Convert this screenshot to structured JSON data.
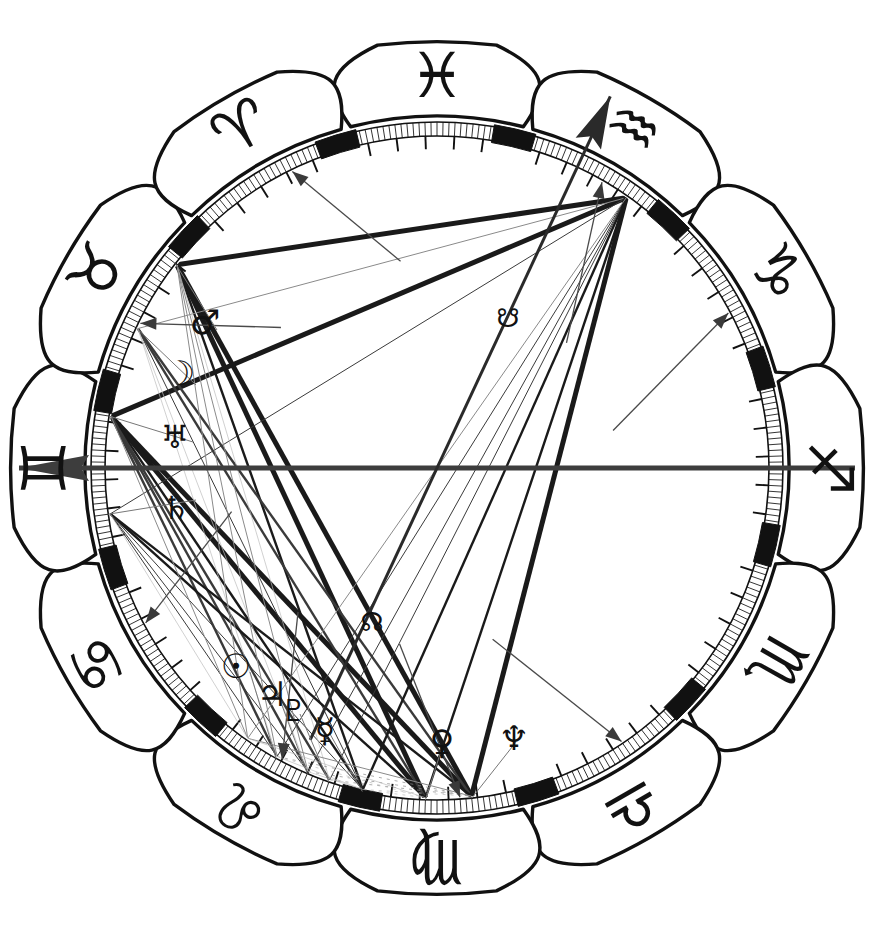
{
  "document": {
    "title": "Astrological Natal Chart Wheel",
    "type": "natal-chart",
    "width": 875,
    "height": 937,
    "background": "#ffffff",
    "ink": "#111111"
  },
  "wheel": {
    "center_x": 437,
    "center_y": 468,
    "outer_petal_radius": 430,
    "rim_outer_radius": 346,
    "rim_inner_radius": 332,
    "aspect_radius": 330,
    "degree_ring": {
      "minor_tick_step_deg": 1,
      "major_tick_step_deg": 5,
      "cusp_marker": "thick-bar",
      "style": "ladder"
    },
    "zero_degree_offset": -77,
    "rotation_note": "wheel rotated so Gemini cusp sits at left horizon"
  },
  "signs": [
    {
      "id": "pisces",
      "name": "Pisces",
      "glyph": "♓",
      "angle_deg": 270,
      "glyph_rotation": 0,
      "element": "water"
    },
    {
      "id": "aquarius",
      "name": "Aquarius",
      "glyph": "♒",
      "angle_deg": 300,
      "glyph_rotation": 30,
      "element": "air"
    },
    {
      "id": "capricorn",
      "name": "Capricorn",
      "glyph": "♑",
      "angle_deg": 330,
      "glyph_rotation": 60,
      "element": "earth"
    },
    {
      "id": "sagittarius",
      "name": "Sagittarius",
      "glyph": "♐",
      "angle_deg": 0,
      "glyph_rotation": 90,
      "element": "fire"
    },
    {
      "id": "scorpio",
      "name": "Scorpio",
      "glyph": "♏",
      "angle_deg": 30,
      "glyph_rotation": 120,
      "element": "water"
    },
    {
      "id": "libra",
      "name": "Libra",
      "glyph": "♎",
      "angle_deg": 60,
      "glyph_rotation": 150,
      "element": "air"
    },
    {
      "id": "virgo",
      "name": "Virgo",
      "glyph": "♍",
      "angle_deg": 90,
      "glyph_rotation": 180,
      "element": "earth"
    },
    {
      "id": "leo",
      "name": "Leo",
      "glyph": "♌",
      "angle_deg": 120,
      "glyph_rotation": 210,
      "element": "fire"
    },
    {
      "id": "cancer",
      "name": "Cancer",
      "glyph": "♋",
      "angle_deg": 150,
      "glyph_rotation": 240,
      "element": "water"
    },
    {
      "id": "gemini",
      "name": "Gemini",
      "glyph": "♊",
      "angle_deg": 180,
      "glyph_rotation": 270,
      "element": "air"
    },
    {
      "id": "taurus",
      "name": "Taurus",
      "glyph": "♉",
      "angle_deg": 210,
      "glyph_rotation": 300,
      "element": "earth"
    },
    {
      "id": "aries",
      "name": "Aries",
      "glyph": "♈",
      "angle_deg": 240,
      "glyph_rotation": 330,
      "element": "fire"
    }
  ],
  "planets": [
    {
      "id": "mars",
      "name": "Mars",
      "glyph": "♂",
      "label_x": 205,
      "label_y": 322,
      "ring_angle_deg": 218.0,
      "point_x": 217,
      "point_y": 330,
      "size": 34
    },
    {
      "id": "moon",
      "name": "Moon",
      "glyph": "☽",
      "label_x": 180,
      "label_y": 373,
      "ring_angle_deg": 205.0,
      "point_x": 196,
      "point_y": 385,
      "size": 34
    },
    {
      "id": "uranus",
      "name": "Uranus",
      "glyph": "♅",
      "label_x": 175,
      "label_y": 437,
      "ring_angle_deg": 189.0,
      "point_x": 193,
      "point_y": 442,
      "size": 32
    },
    {
      "id": "saturn",
      "name": "Saturn",
      "glyph": "♄",
      "label_x": 176,
      "label_y": 508,
      "ring_angle_deg": 172.0,
      "point_x": 196,
      "point_y": 500,
      "size": 32
    },
    {
      "id": "sun",
      "name": "Sun",
      "glyph": "☉",
      "label_x": 236,
      "label_y": 666,
      "ring_angle_deg": 119.0,
      "point_x": 250,
      "point_y": 672,
      "size": 34
    },
    {
      "id": "jupiter",
      "name": "Jupiter",
      "glyph": "♃",
      "label_x": 272,
      "label_y": 694,
      "ring_angle_deg": 113.0,
      "point_x": 280,
      "point_y": 700,
      "size": 34
    },
    {
      "id": "pluto",
      "name": "Pluto",
      "glyph": "♇",
      "label_x": 294,
      "label_y": 710,
      "ring_angle_deg": 109.0,
      "point_x": 300,
      "point_y": 714,
      "size": 30
    },
    {
      "id": "mercury",
      "name": "Mercury",
      "glyph": "☿",
      "label_x": 325,
      "label_y": 730,
      "ring_angle_deg": 103.0,
      "point_x": 330,
      "point_y": 734,
      "size": 34
    },
    {
      "id": "venus",
      "name": "Venus",
      "glyph": "♀",
      "label_x": 442,
      "label_y": 742,
      "ring_angle_deg": 92.0,
      "point_x": 442,
      "point_y": 748,
      "size": 34
    },
    {
      "id": "neptune",
      "name": "Neptune",
      "glyph": "♆",
      "label_x": 514,
      "label_y": 738,
      "ring_angle_deg": 84.0,
      "point_x": 516,
      "point_y": 742,
      "size": 34
    },
    {
      "id": "south-node",
      "name": "South Node",
      "glyph": "☋",
      "label_x": 508,
      "label_y": 318,
      "ring_angle_deg": 305.0,
      "point_x": 508,
      "point_y": 318,
      "size": 26
    },
    {
      "id": "north-node",
      "name": "North Node",
      "glyph": "☊",
      "label_x": 372,
      "label_y": 622,
      "ring_angle_deg": 125.0,
      "point_x": 372,
      "point_y": 622,
      "size": 26
    }
  ],
  "axes": [
    {
      "id": "ascendant-axis",
      "name": "Ascendant / Descendant",
      "angle_deg": 180,
      "arrow_end": "left",
      "weight": 5,
      "color": "#3d3d3d"
    },
    {
      "id": "midheaven-axis",
      "name": "Midheaven / IC",
      "angle_deg": 295,
      "arrow_end": "upper-right",
      "weight": 3,
      "color": "#2a2a2a"
    }
  ],
  "house_cusps_deg": [
    180,
    210,
    240,
    270,
    300,
    330,
    0,
    30,
    60,
    90,
    120,
    150
  ],
  "aspect_lines": {
    "count": 46,
    "weights": {
      "major": 5.0,
      "medium": 2.4,
      "minor": 1.0,
      "faint": 0.7
    },
    "styles": [
      "solid",
      "dotted"
    ],
    "colors": {
      "strong": "#1a1a1a",
      "mid": "#3a3a3a",
      "light": "#8a8a8a",
      "ghost": "#bdbdbd"
    }
  },
  "node_pointers": {
    "count": 10,
    "description": "thin leader lines from planet glyphs to their degree positions on the rim"
  }
}
